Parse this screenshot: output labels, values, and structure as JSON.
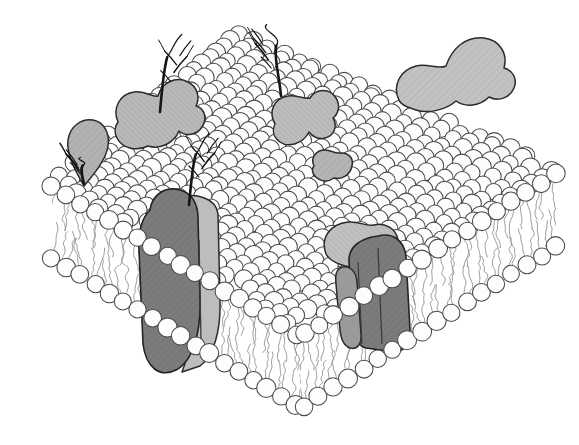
{
  "figure": {
    "title": "Fluid Mosaic Model of the Plasma Membrane",
    "subject": "phospholipid-bilayer-cutaway",
    "style": "black-and-white line drawing with gray shading",
    "background_color": "#ffffff"
  },
  "colors": {
    "background": "#ffffff",
    "lipid_head_fill": "#fdfdfd",
    "lipid_head_stroke": "#4a4a4a",
    "tail_stroke": "#8e8e8e",
    "peripheral_protein_fill": "#b9b9b9",
    "peripheral_protein_fill_light": "#c6c6c6",
    "integral_protein_dark_fill": "#7c7c7c",
    "integral_protein_light_fill": "#bdbdbd",
    "outline_stroke": "#2b2b2b",
    "carbohydrate_stroke": "#151515"
  },
  "geometry": {
    "top_surface": "rhombus seen in oblique perspective",
    "cut_faces": 2,
    "vertex_x": 300,
    "vertex_y": 402,
    "left_corner": [
      52,
      180
    ],
    "right_corner": [
      556,
      168
    ],
    "leaflets": [
      "outer leaflet",
      "inner leaflet"
    ]
  },
  "components": {
    "lipid_head_label": "phospholipid head group",
    "lipid_tail_label": "fatty acid tail",
    "peripheral_label": "peripheral membrane protein",
    "integral_label": "integral transmembrane protein",
    "carbohydrate_label": "carbohydrate chain"
  },
  "peripheral_proteins": [
    {
      "id": "p1",
      "name": "heart-shaped-glycoprotein",
      "cx": 152,
      "cy": 118,
      "shade": "#b9b9b9"
    },
    {
      "id": "p2",
      "name": "teardrop-protein-left-edge",
      "cx": 80,
      "cy": 150,
      "shade": "#b3b3b3"
    },
    {
      "id": "p3",
      "name": "lobed-protein-upper-center",
      "cx": 302,
      "cy": 122,
      "shade": "#bdbdbd"
    },
    {
      "id": "p4",
      "name": "peanut-protein-upper-right",
      "cx": 446,
      "cy": 62,
      "shade": "#c2c2c2"
    },
    {
      "id": "p5",
      "name": "small-protein-center",
      "cx": 330,
      "cy": 168,
      "shade": "#b5b5b5"
    },
    {
      "id": "p6",
      "name": "protein-right-mid",
      "cx": 452,
      "cy": 160,
      "shade": "#bbbbbb"
    }
  ],
  "integral_proteins": [
    {
      "id": "i1",
      "name": "integral-protein-left",
      "x": 140,
      "y": 196,
      "width": 80,
      "height": 176,
      "dark_fill": "#7c7c7c",
      "light_fill": "#bdbdbd"
    },
    {
      "id": "i2",
      "name": "integral-protein-right",
      "x": 330,
      "y": 228,
      "width": 100,
      "height": 124,
      "dark_fill": "#7c7c7c",
      "light_fill": "#c0c0c0"
    }
  ],
  "carbohydrate_chains": [
    {
      "id": "c1",
      "name": "carbohydrate-chain-upper-left",
      "root_x": 160,
      "root_y": 112,
      "height": 76
    },
    {
      "id": "c2",
      "name": "carbohydrate-chain-upper-center",
      "root_x": 281,
      "root_y": 96,
      "height": 70
    },
    {
      "id": "c3",
      "name": "carbohydrate-chain-mid-left",
      "root_x": 189,
      "root_y": 205,
      "height": 70
    },
    {
      "id": "c4",
      "name": "carbohydrate-chain-left-edge",
      "root_x": 84,
      "root_y": 184,
      "height": 26
    }
  ],
  "counts": {
    "peripheral_proteins": 6,
    "integral_proteins": 2,
    "carbohydrate_chains": 4
  }
}
